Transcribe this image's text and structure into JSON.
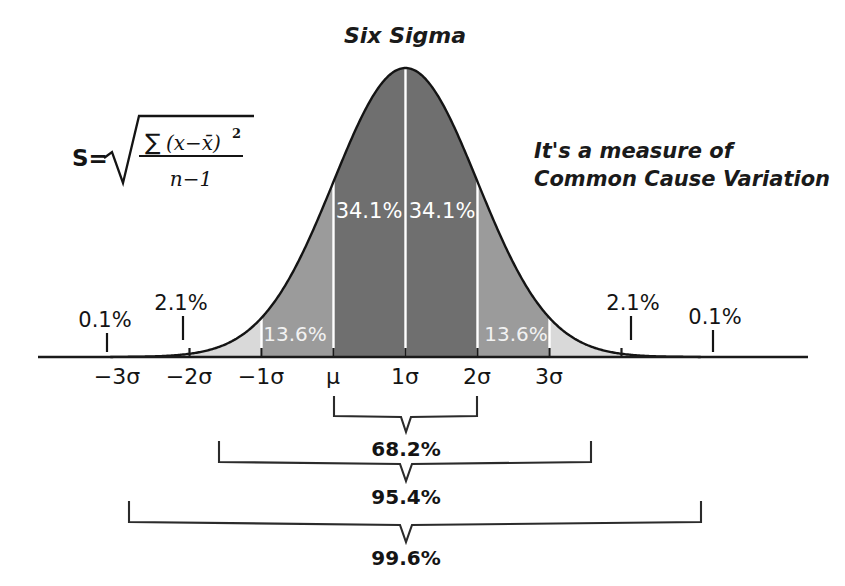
{
  "title": "Six Sigma",
  "annotation": {
    "line1": "It's a measure of",
    "line2": "Common Cause Variation"
  },
  "formula": {
    "lhs": "S=",
    "radical": "√",
    "numerator_sum": "∑",
    "numerator_body": "(x−x̄)",
    "numerator_exponent": "2",
    "denominator": "n−1",
    "full_text": "S = √( ∑(x−x̄)² / (n−1) )"
  },
  "colors": {
    "dark_band": "#6f6f6f",
    "mid_band": "#9b9b9b",
    "light_band": "#d9d9d9",
    "curve_stroke": "#1a1a1a",
    "axis": "#1a1a1a",
    "divider_white": "#ffffff",
    "text": "#141414"
  },
  "axis": {
    "ticks": [
      "−3σ",
      "−2σ",
      "−1σ",
      "μ",
      "1σ",
      "2σ",
      "3σ"
    ],
    "tick_sigma_values": [
      -3,
      -2,
      -1,
      0,
      1,
      2,
      3
    ]
  },
  "region_labels": {
    "outer_left_tail": "0.1%",
    "left_two_sigma": "2.1%",
    "left_one_sigma": "13.6%",
    "left_center": "34.1%",
    "right_center": "34.1%",
    "right_one_sigma": "13.6%",
    "right_two_sigma": "2.1%",
    "outer_right_tail": "0.1%"
  },
  "brackets": [
    {
      "label": "68.2%",
      "from": "−1σ",
      "to": "1σ"
    },
    {
      "label": "95.4%",
      "from": "−2σ",
      "to": "2σ"
    },
    {
      "label": "99.6%",
      "from": "−3σ",
      "to": "3σ"
    }
  ],
  "chart_data": {
    "type": "area",
    "title": "Six Sigma",
    "xlabel": "",
    "ylabel": "",
    "distribution": "normal",
    "mean": 0,
    "std_dev": 1,
    "xlim": [
      -4.1,
      4.1
    ],
    "ylim": [
      0,
      0.4
    ],
    "grid": false,
    "legend_position": "none",
    "x_tick_values": [
      -3,
      -2,
      -1,
      0,
      1,
      2,
      3
    ],
    "x_tick_labels": [
      "−3σ",
      "−2σ",
      "−1σ",
      "μ",
      "1σ",
      "2σ",
      "3σ"
    ],
    "bands": [
      {
        "from": -4.1,
        "to": -3,
        "percent": 0.1,
        "label": "0.1%",
        "shade": "#ffffff",
        "label_placement": "outside-above"
      },
      {
        "from": -3,
        "to": -2,
        "percent": 2.1,
        "label": "2.1%",
        "shade": "#d9d9d9",
        "label_placement": "outside-above"
      },
      {
        "from": -2,
        "to": -1,
        "percent": 13.6,
        "label": "13.6%",
        "shade": "#9b9b9b",
        "label_placement": "inside"
      },
      {
        "from": -1,
        "to": 0,
        "percent": 34.1,
        "label": "34.1%",
        "shade": "#6f6f6f",
        "label_placement": "inside"
      },
      {
        "from": 0,
        "to": 1,
        "percent": 34.1,
        "label": "34.1%",
        "shade": "#6f6f6f",
        "label_placement": "inside"
      },
      {
        "from": 1,
        "to": 2,
        "percent": 13.6,
        "label": "13.6%",
        "shade": "#9b9b9b",
        "label_placement": "inside"
      },
      {
        "from": 2,
        "to": 3,
        "percent": 2.1,
        "label": "2.1%",
        "shade": "#d9d9d9",
        "label_placement": "outside-above"
      },
      {
        "from": 3,
        "to": 4.1,
        "percent": 0.1,
        "label": "0.1%",
        "shade": "#ffffff",
        "label_placement": "outside-above"
      }
    ],
    "cumulative_brackets": [
      {
        "range_sigma": [
          -1,
          1
        ],
        "label": "68.2%",
        "value": 68.2
      },
      {
        "range_sigma": [
          -2,
          2
        ],
        "label": "95.4%",
        "value": 95.4
      },
      {
        "range_sigma": [
          -3,
          3
        ],
        "label": "99.6%",
        "value": 99.6
      }
    ],
    "annotations": [
      {
        "text": "It's a measure of Common Cause Variation",
        "position": "upper-right"
      },
      {
        "text": "S = √(∑(x−x̄)²/(n−1))",
        "position": "upper-left"
      }
    ]
  }
}
